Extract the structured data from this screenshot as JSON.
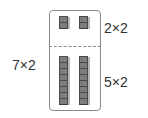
{
  "diagram": {
    "total_label": "7×2",
    "top_label": "2×2",
    "bottom_label": "5×2",
    "top_group": {
      "columns": 2,
      "rows": 2
    },
    "bottom_group": {
      "columns": 2,
      "rows": 5
    },
    "colors": {
      "block_fill": "#7d7d7d",
      "block_edge": "#4a4a4a",
      "frame": "#8a8a8a"
    }
  }
}
